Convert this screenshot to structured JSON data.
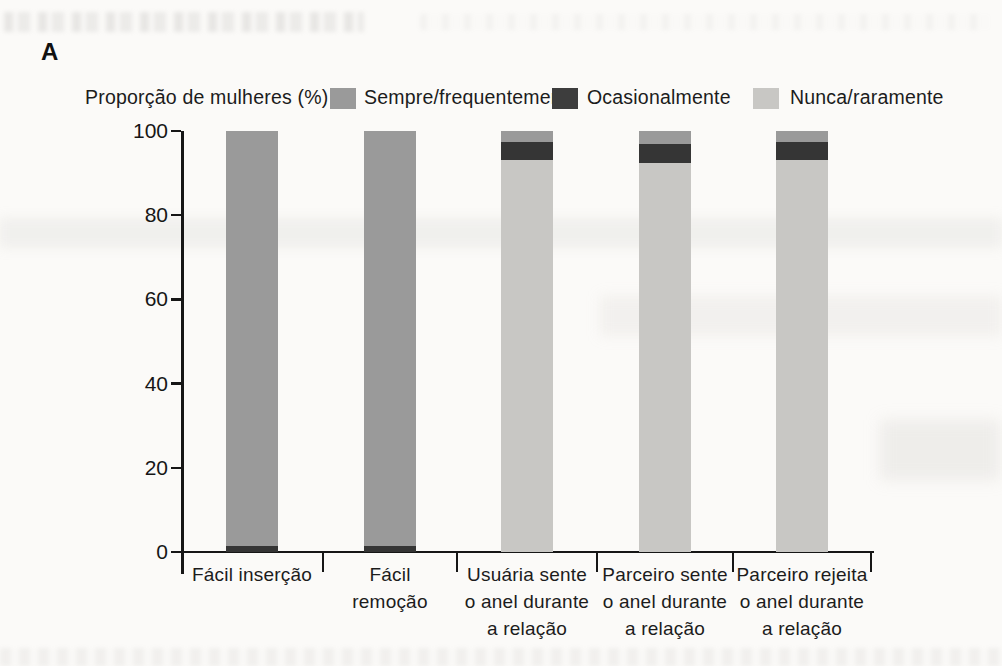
{
  "panel_label": "A",
  "axis_title": "Proporção de mulheres (%)",
  "legend": [
    {
      "label": "Sempre/frequentemente",
      "color": "#9a9a9a"
    },
    {
      "label": "Ocasionalmente",
      "color": "#3d3d3d"
    },
    {
      "label": "Nunca/raramente",
      "color": "#c8c7c4"
    }
  ],
  "chart_data": {
    "type": "bar",
    "stacked": true,
    "title": "",
    "ylabel": "Proporção de mulheres (%)",
    "xlabel": "",
    "ylim": [
      0,
      100
    ],
    "yticks": [
      0,
      20,
      40,
      60,
      80,
      100
    ],
    "grid": false,
    "legend_position": "top",
    "categories": [
      "Fácil inserção",
      "Fácil remoção",
      "Usuária sente o anel durante a relação",
      "Parceiro sente o anel durante a relação",
      "Parceiro rejeita o anel durante a relação"
    ],
    "category_display_lines": [
      [
        "Fácil inserção"
      ],
      [
        "Fácil",
        "remoção"
      ],
      [
        "Usuária sente",
        "o anel durante",
        "a relação"
      ],
      [
        "Parceiro sente",
        "o anel durante",
        "a relação"
      ],
      [
        "Parceiro rejeita",
        "o anel durante",
        "a relação"
      ]
    ],
    "stack_order_bottom_to_top": [
      "Nunca/raramente",
      "Ocasionalmente",
      "Sempre/frequentemente"
    ],
    "series": [
      {
        "name": "Nunca/raramente",
        "color": "#c8c7c4",
        "values": [
          0,
          0,
          93,
          92.5,
          93
        ]
      },
      {
        "name": "Ocasionalmente",
        "color": "#353535",
        "values": [
          1.5,
          1.5,
          4.5,
          4.5,
          4.5
        ]
      },
      {
        "name": "Sempre/frequentemente",
        "color": "#9a9a9a",
        "values": [
          98.5,
          98.5,
          2.5,
          3,
          2.5
        ]
      }
    ]
  }
}
